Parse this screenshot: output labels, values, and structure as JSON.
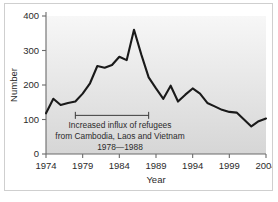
{
  "figure": {
    "background_color": "#ffffff",
    "frame_color": "#cfcfcf",
    "plot_fill_top": "#f6f6f6",
    "plot_fill_bottom": "#d8d8d8",
    "line_color": "#1a1a1a",
    "axis_color": "#6b6b6b",
    "text_color": "#2b2b2b"
  },
  "axes": {
    "y_title": "Number",
    "x_title": "Year",
    "y_ticks": [
      "0",
      "100",
      "200",
      "300",
      "400"
    ],
    "x_ticks": [
      "1974",
      "1979",
      "1984",
      "1989",
      "1994",
      "1999",
      "2004"
    ]
  },
  "annotation": {
    "line1": "Increased influx of refugees",
    "line2": "from Cambodia, Laos and Vietnam",
    "line3": "1978—1988",
    "bracket_start_year": 1978,
    "bracket_end_year": 1988,
    "bracket_value": 112
  },
  "chart_data": {
    "type": "line",
    "title": "",
    "subtitle": "",
    "xlabel": "Year",
    "ylabel": "Number",
    "xlim": [
      1974,
      2004
    ],
    "ylim": [
      0,
      400
    ],
    "grid": false,
    "legend": null,
    "annotations": [
      "Increased influx of refugees",
      "from Cambodia, Laos and Vietnam",
      "1978—1988"
    ],
    "x": [
      1974,
      1975,
      1976,
      1977,
      1978,
      1979,
      1980,
      1981,
      1982,
      1983,
      1984,
      1985,
      1986,
      1987,
      1988,
      1989,
      1990,
      1991,
      1992,
      1993,
      1994,
      1995,
      1996,
      1997,
      1998,
      1999,
      2000,
      2001,
      2002,
      2003,
      2004
    ],
    "y": [
      118,
      160,
      142,
      148,
      152,
      175,
      205,
      255,
      250,
      258,
      282,
      272,
      360,
      288,
      222,
      190,
      160,
      198,
      152,
      172,
      190,
      175,
      148,
      138,
      128,
      122,
      120,
      100,
      80,
      95,
      103
    ],
    "series": [
      {
        "name": "Number",
        "values": [
          118,
          160,
          142,
          148,
          152,
          175,
          205,
          255,
          250,
          258,
          282,
          272,
          360,
          288,
          222,
          190,
          160,
          198,
          152,
          172,
          190,
          175,
          148,
          138,
          128,
          122,
          120,
          100,
          80,
          95,
          103
        ]
      }
    ]
  }
}
